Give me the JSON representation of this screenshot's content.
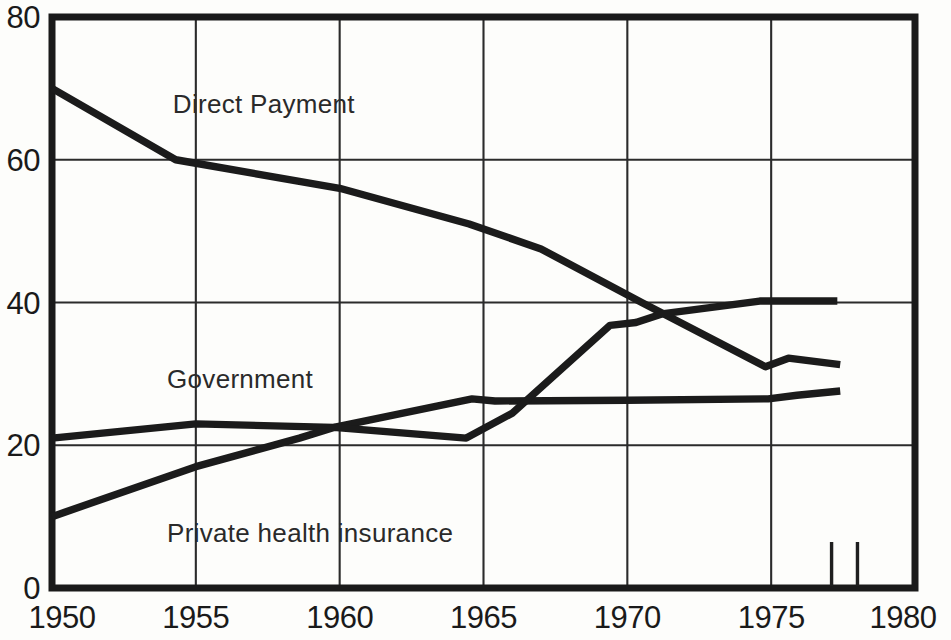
{
  "chart_data": {
    "type": "line",
    "title": "",
    "subtitle": "",
    "xlabel": "",
    "ylabel": "",
    "xlim": [
      1950,
      1980
    ],
    "ylim": [
      0,
      80
    ],
    "yticks": [
      0,
      20,
      40,
      60,
      80
    ],
    "xticks": [
      1950,
      1955,
      1960,
      1965,
      1970,
      1975,
      1980
    ],
    "ytick_labels": [
      "0",
      "20",
      "40",
      "60",
      "80"
    ],
    "xtick_labels": [
      "1950",
      "1955",
      "1960",
      "1965",
      "1970",
      "1975",
      "1980"
    ],
    "grid": "both",
    "legend_position": "inline-annotations",
    "series": [
      {
        "name": "Direct Payment",
        "label_x": 1954.2,
        "label_y": 66.5,
        "x": [
          1950,
          1954.3,
          1960,
          1964.5,
          1967,
          1970.5,
          1974.8,
          1975.6,
          1977.4
        ],
        "values": [
          70,
          60,
          56,
          51,
          47.5,
          40,
          31,
          32.2,
          31.3
        ]
      },
      {
        "name": "Government",
        "label_x": 1954.0,
        "label_y": 28.0,
        "x": [
          1950,
          1955,
          1959.8,
          1964.6,
          1965.4,
          1970,
          1974.9,
          1975.9,
          1977.4
        ],
        "values": [
          21,
          23,
          22.5,
          26.5,
          26.2,
          26.3,
          26.5,
          27.0,
          27.6
        ]
      },
      {
        "name": "Private health insurance",
        "label_x": 1954.0,
        "label_y": 6.5,
        "x": [
          1950,
          1955,
          1958.6,
          1959.8,
          1964.4,
          1966,
          1969.4,
          1970.3,
          1971.2,
          1974.6,
          1977.3
        ],
        "values": [
          10,
          17,
          21,
          22.5,
          21,
          24.5,
          36.8,
          37.2,
          38.4,
          40.2,
          40.2
        ]
      }
    ],
    "bottom_ticks": [
      1977.1,
      1978.0
    ],
    "colors": {
      "line": "#1b1b1b",
      "grid": "#2b2b2b",
      "frame": "#1a1a1a",
      "background": "#fdfdfb",
      "text": "#1a1a1a"
    }
  }
}
